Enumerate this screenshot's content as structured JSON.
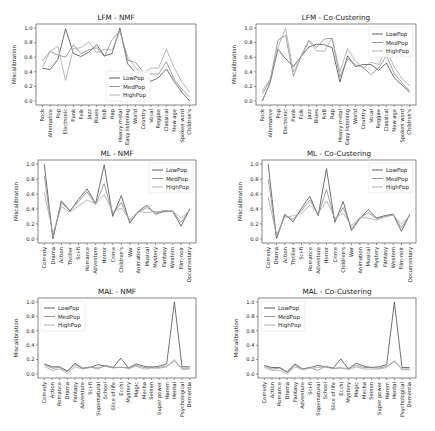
{
  "figure": {
    "colors": {
      "LowPop": "#4d4d4d",
      "MedPop": "#8a8a8a",
      "HighPop": "#a6a6a6",
      "frame": "#555555",
      "text": "#222222"
    },
    "legend_entries": [
      "LowPop",
      "MedPop",
      "HighPop"
    ]
  },
  "chart_data": [
    {
      "id": "lfm-nmf",
      "type": "line",
      "title": "LFM - NMF",
      "xlabel": "",
      "ylabel": "Miscalibration",
      "ylim": [
        0.0,
        1.0
      ],
      "yticks": [
        "0.0",
        "0.2",
        "0.4",
        "0.6",
        "0.8",
        "1.0"
      ],
      "grid": false,
      "legend_position": "lower center",
      "frame": {
        "x": 36,
        "y": 24,
        "w": 160,
        "h": 81
      },
      "categories": [
        "Rock",
        "Alternative",
        "Pop",
        "Electronic",
        "Punk",
        "Folk",
        "Jazz",
        "Blues",
        "RnB",
        "Rap",
        "Heavy metal",
        "Easy listening",
        "World",
        "Country",
        "Vocal",
        "Reggae",
        "Classical",
        "New age",
        "Spoken word",
        "Children's"
      ],
      "series": [
        {
          "name": "LowPop",
          "values": [
            0.45,
            0.43,
            0.57,
            0.99,
            0.65,
            0.61,
            0.67,
            0.77,
            0.62,
            0.65,
            1.0,
            0.51,
            0.39,
            0.38,
            0.27,
            0.32,
            0.44,
            0.27,
            0.12,
            0.0
          ]
        },
        {
          "name": "MedPop",
          "values": [
            0.55,
            0.68,
            0.63,
            0.6,
            0.77,
            0.65,
            0.7,
            0.73,
            0.61,
            0.84,
            0.96,
            0.56,
            0.53,
            0.4,
            0.37,
            0.37,
            0.54,
            0.3,
            0.16,
            0.05
          ]
        },
        {
          "name": "HighPop",
          "values": [
            0.46,
            0.68,
            0.75,
            0.28,
            0.72,
            0.73,
            0.81,
            0.66,
            0.71,
            0.7,
            0.96,
            0.61,
            0.45,
            0.38,
            0.45,
            0.45,
            0.71,
            0.46,
            0.26,
            0.12
          ]
        }
      ]
    },
    {
      "id": "lfm-cocluster",
      "type": "line",
      "title": "LFM - Co-Custering",
      "xlabel": "",
      "ylabel": "Miscalibration",
      "ylim": [
        0.0,
        1.0
      ],
      "yticks": [
        "0.0",
        "0.2",
        "0.4",
        "0.6",
        "0.8",
        "1.0"
      ],
      "grid": false,
      "legend_position": "upper right",
      "frame": {
        "x": 256,
        "y": 24,
        "w": 160,
        "h": 81
      },
      "categories": [
        "Rock",
        "Alternative",
        "Pop",
        "Electronic",
        "Punk",
        "Folk",
        "Jazz",
        "Blues",
        "RnB",
        "Rap",
        "Heavy metal",
        "Easy listening",
        "World",
        "Country",
        "Vocal",
        "Reggae",
        "Classical",
        "New age",
        "Spoken word",
        "Children's"
      ],
      "series": [
        {
          "name": "LowPop",
          "values": [
            0.0,
            0.25,
            0.71,
            0.58,
            0.47,
            0.61,
            0.74,
            0.78,
            0.77,
            0.73,
            0.26,
            0.62,
            0.47,
            0.5,
            0.5,
            0.42,
            0.52,
            0.32,
            0.22,
            0.12
          ]
        },
        {
          "name": "MedPop",
          "values": [
            0.1,
            0.28,
            0.83,
            0.9,
            0.34,
            0.62,
            0.83,
            0.73,
            0.85,
            0.86,
            0.33,
            0.58,
            0.5,
            0.46,
            0.36,
            0.45,
            0.62,
            0.38,
            0.25,
            0.14
          ]
        },
        {
          "name": "HighPop",
          "values": [
            0.14,
            0.3,
            0.73,
            1.0,
            0.4,
            0.6,
            0.82,
            0.69,
            0.68,
            0.86,
            0.4,
            0.72,
            0.55,
            0.45,
            0.53,
            0.5,
            0.71,
            0.47,
            0.31,
            0.21
          ]
        }
      ]
    },
    {
      "id": "ml-nmf",
      "type": "line",
      "title": "ML - NMF",
      "xlabel": "",
      "ylabel": "Miscalibration",
      "ylim": [
        0.0,
        1.0
      ],
      "yticks": [
        "0.0",
        "0.2",
        "0.4",
        "0.6",
        "0.8",
        "1.0"
      ],
      "grid": false,
      "legend_position": "upper right",
      "frame": {
        "x": 38,
        "y": 160,
        "w": 158,
        "h": 83
      },
      "categories": [
        "Comedy",
        "Drama",
        "Action",
        "Thriller",
        "Sci-fi",
        "Romance",
        "Adventure",
        "Horror",
        "Crime",
        "Children's",
        "War",
        "Animation",
        "Musical",
        "Mystery",
        "Fantasy",
        "Western",
        "Film-noir",
        "Documentary"
      ],
      "series": [
        {
          "name": "LowPop",
          "values": [
            1.0,
            0.0,
            0.51,
            0.37,
            0.53,
            0.67,
            0.47,
            0.99,
            0.3,
            0.58,
            0.21,
            0.37,
            0.45,
            0.33,
            0.37,
            0.37,
            0.17,
            0.4
          ]
        },
        {
          "name": "MedPop",
          "values": [
            0.84,
            0.02,
            0.48,
            0.38,
            0.5,
            0.63,
            0.46,
            0.74,
            0.33,
            0.49,
            0.23,
            0.36,
            0.42,
            0.35,
            0.38,
            0.37,
            0.22,
            0.39
          ]
        },
        {
          "name": "HighPop",
          "values": [
            0.62,
            0.07,
            0.43,
            0.36,
            0.44,
            0.52,
            0.47,
            0.59,
            0.37,
            0.41,
            0.26,
            0.37,
            0.35,
            0.37,
            0.36,
            0.37,
            0.28,
            0.38
          ]
        }
      ]
    },
    {
      "id": "ml-cocluster",
      "type": "line",
      "title": "ML - Co-Custering",
      "xlabel": "",
      "ylabel": "Miscalibration",
      "ylim": [
        0.0,
        1.0
      ],
      "yticks": [
        "0.0",
        "0.2",
        "0.4",
        "0.6",
        "0.8",
        "1.0"
      ],
      "grid": false,
      "legend_position": "upper right",
      "frame": {
        "x": 262,
        "y": 160,
        "w": 154,
        "h": 83
      },
      "categories": [
        "Comedy",
        "Drama",
        "Action",
        "Thriller",
        "Sci-fi",
        "Romance",
        "Adventure",
        "Horror",
        "Crime",
        "Children's",
        "War",
        "Animation",
        "Musical",
        "Mystery",
        "Fantasy",
        "Western",
        "Film-noir",
        "Documentary"
      ],
      "series": [
        {
          "name": "LowPop",
          "values": [
            1.0,
            0.0,
            0.33,
            0.23,
            0.41,
            0.57,
            0.31,
            0.94,
            0.22,
            0.5,
            0.11,
            0.27,
            0.39,
            0.28,
            0.31,
            0.33,
            0.1,
            0.33
          ]
        },
        {
          "name": "MedPop",
          "values": [
            0.8,
            0.02,
            0.31,
            0.26,
            0.38,
            0.52,
            0.32,
            0.66,
            0.25,
            0.42,
            0.14,
            0.28,
            0.35,
            0.27,
            0.3,
            0.32,
            0.15,
            0.32
          ]
        },
        {
          "name": "HighPop",
          "values": [
            0.56,
            0.05,
            0.29,
            0.31,
            0.34,
            0.45,
            0.34,
            0.51,
            0.28,
            0.34,
            0.18,
            0.28,
            0.28,
            0.25,
            0.29,
            0.32,
            0.2,
            0.31
          ]
        }
      ]
    },
    {
      "id": "mal-nmf",
      "type": "line",
      "title": "MAL - NMF",
      "xlabel": "",
      "ylabel": "Miscalibration",
      "ylim": [
        0.0,
        1.0
      ],
      "yticks": [
        "0.0",
        "0.2",
        "0.4",
        "0.6",
        "0.8",
        "1.0"
      ],
      "grid": false,
      "legend_position": "upper left",
      "frame": {
        "x": 38,
        "y": 298,
        "w": 158,
        "h": 80
      },
      "categories": [
        "Comedy",
        "Action",
        "Romance",
        "Drama",
        "Fantasy",
        "Adventure",
        "Sci-fi",
        "Supernatural",
        "School",
        "Slice of life",
        "Ecchi",
        "Mystery",
        "Magic",
        "Mecha",
        "Seinen",
        "Super power",
        "Harem",
        "Hentai",
        "Psychological",
        "Dementia"
      ],
      "series": [
        {
          "name": "LowPop",
          "values": [
            0.14,
            0.1,
            0.1,
            0.04,
            0.15,
            0.08,
            0.09,
            0.13,
            0.11,
            0.09,
            0.22,
            0.08,
            0.14,
            0.11,
            0.09,
            0.11,
            0.14,
            1.0,
            0.1,
            0.1
          ]
        },
        {
          "name": "MedPop",
          "values": [
            0.13,
            0.08,
            0.09,
            0.03,
            0.13,
            0.08,
            0.1,
            0.07,
            0.12,
            0.09,
            0.09,
            0.09,
            0.12,
            0.09,
            0.1,
            0.09,
            0.11,
            0.18,
            0.08,
            0.08
          ]
        },
        {
          "name": "HighPop",
          "values": [
            0.11,
            0.05,
            0.07,
            0.01,
            0.1,
            0.07,
            0.09,
            0.09,
            0.11,
            0.08,
            0.1,
            0.07,
            0.11,
            0.07,
            0.08,
            0.08,
            0.1,
            0.2,
            0.06,
            0.07
          ]
        }
      ]
    },
    {
      "id": "mal-cocluster",
      "type": "line",
      "title": "MAL - Co-Custering",
      "xlabel": "",
      "ylabel": "Miscalibration",
      "ylim": [
        0.0,
        1.0
      ],
      "yticks": [
        "0.0",
        "0.2",
        "0.4",
        "0.6",
        "0.8",
        "1.0"
      ],
      "grid": false,
      "legend_position": "upper left",
      "frame": {
        "x": 258,
        "y": 298,
        "w": 158,
        "h": 80
      },
      "categories": [
        "Comedy",
        "Action",
        "Romance",
        "Drama",
        "Fantasy",
        "Adventure",
        "Sci-fi",
        "Supernatural",
        "School",
        "Slice of life",
        "Ecchi",
        "Mystery",
        "Magic",
        "Mecha",
        "Seinen",
        "Super power",
        "Harem",
        "Hentai",
        "Psychological",
        "Dementia"
      ],
      "series": [
        {
          "name": "LowPop",
          "values": [
            0.12,
            0.09,
            0.09,
            0.03,
            0.14,
            0.07,
            0.09,
            0.12,
            0.1,
            0.08,
            0.21,
            0.07,
            0.15,
            0.11,
            0.09,
            0.1,
            0.13,
            1.0,
            0.09,
            0.09
          ]
        },
        {
          "name": "MedPop",
          "values": [
            0.11,
            0.07,
            0.08,
            0.02,
            0.12,
            0.07,
            0.09,
            0.05,
            0.11,
            0.08,
            0.08,
            0.08,
            0.12,
            0.09,
            0.09,
            0.08,
            0.11,
            0.17,
            0.07,
            0.07
          ]
        },
        {
          "name": "HighPop",
          "values": [
            0.09,
            0.05,
            0.05,
            0.0,
            0.1,
            0.06,
            0.08,
            0.09,
            0.1,
            0.07,
            0.09,
            0.06,
            0.1,
            0.07,
            0.07,
            0.07,
            0.09,
            0.19,
            0.06,
            0.06
          ]
        }
      ]
    }
  ]
}
